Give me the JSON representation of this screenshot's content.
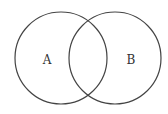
{
  "diagram": {
    "type": "venn",
    "stroke_color": "#444444",
    "sets": [
      {
        "label": "A",
        "cx": 61,
        "cy": 58,
        "r": 46
      },
      {
        "label": "B",
        "cx": 115,
        "cy": 58,
        "r": 46
      }
    ]
  }
}
